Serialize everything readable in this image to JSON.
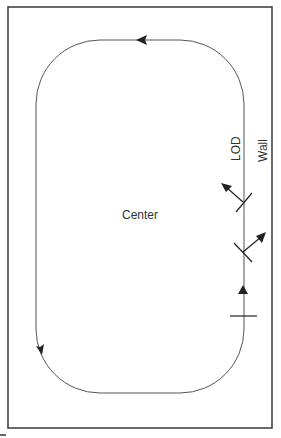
{
  "diagram": {
    "labels": {
      "center": "Center",
      "lod": "LOD",
      "wall": "Wall"
    },
    "colors": {
      "stroke": "#333333",
      "frame": "#444444",
      "background": "#ffffff"
    },
    "elements": {
      "frame": "outer wall rectangle",
      "track": "rounded oval line of dance",
      "direction_arrows": [
        "top-left-pointing",
        "bottom-left-down-pointing"
      ],
      "markers": [
        {
          "name": "diagonal-to-center",
          "arrow": "up-left"
        },
        {
          "name": "diagonal-to-wall",
          "arrow": "up-right"
        },
        {
          "name": "facing-lod",
          "arrow": "up"
        }
      ]
    }
  }
}
